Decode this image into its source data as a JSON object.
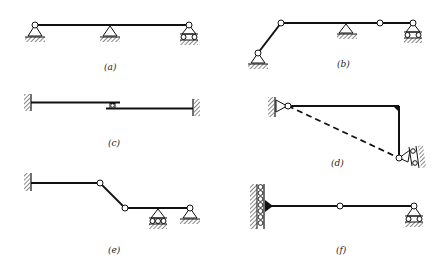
{
  "figure": {
    "colors": {
      "line": "#111111",
      "background": "#ffffff"
    },
    "panels": [
      {
        "id": "a",
        "label": "(a)",
        "description": "Continuous beam on pin, pin and roller supports"
      },
      {
        "id": "b",
        "label": "(b)",
        "description": "Beam with inclined member, internal hinges, pin and roller supports"
      },
      {
        "id": "c",
        "label": "(c)",
        "description": "Two cantilevers from fixed walls connected by a sliding roller link"
      },
      {
        "id": "d",
        "label": "(d)",
        "description": "Rigid L-frame pinned at wall with inclined roller support and dashed chord"
      },
      {
        "id": "e",
        "label": "(e)",
        "description": "Fixed-end beam with hinges, inclined segment, roller and pin supports"
      },
      {
        "id": "f",
        "label": "(f)",
        "description": "Beam rigidly attached to roller-guided wall, internal hinge, roller support"
      }
    ]
  }
}
